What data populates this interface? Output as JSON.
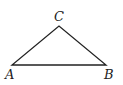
{
  "diagram": {
    "type": "triangle",
    "stroke_color": "#222222",
    "vertices": [
      {
        "label": "A",
        "x": 12,
        "y": 65
      },
      {
        "label": "B",
        "x": 106,
        "y": 65
      },
      {
        "label": "C",
        "x": 59,
        "y": 26
      }
    ],
    "labels": {
      "A": "A",
      "B": "B",
      "C": "C"
    }
  }
}
